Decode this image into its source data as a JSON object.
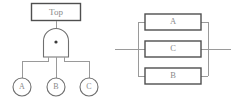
{
  "figure": {
    "background_color": "#ffffff",
    "line_color": "#9a9a9a",
    "outline_color": "#6f6f6f",
    "block_outline_color": "#4f4f4f",
    "text_color": "#8a8a8a"
  },
  "fault_tree": {
    "top_event": {
      "label": "Top"
    },
    "gate": {
      "type": "and-gate",
      "marker": "dot"
    },
    "basic_events": [
      {
        "label": "A"
      },
      {
        "label": "B"
      },
      {
        "label": "C"
      }
    ]
  },
  "block_diagram": {
    "blocks": [
      {
        "label": "A",
        "position": "top"
      },
      {
        "label": "C",
        "position": "middle"
      },
      {
        "label": "B",
        "position": "bottom"
      }
    ],
    "input_line": true,
    "output_line": true,
    "configuration": "parallel"
  }
}
